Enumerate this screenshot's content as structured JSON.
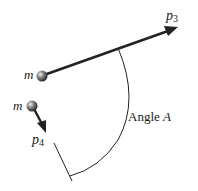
{
  "diagram": {
    "labels": {
      "mass_1": "m",
      "mass_2": "m",
      "momentum_3_base": "p",
      "momentum_3_sub": "3",
      "momentum_4_base": "p",
      "momentum_4_sub": "4",
      "angle": "Angle A"
    },
    "colors": {
      "line": "#222222",
      "ball": "#777777"
    }
  }
}
